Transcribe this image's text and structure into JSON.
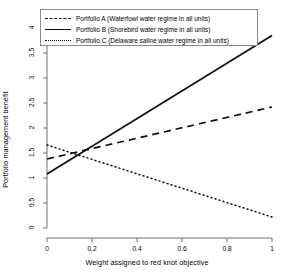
{
  "chart_data": {
    "type": "line",
    "title": "",
    "xlabel": "Weight assigned to red knot objective",
    "ylabel": "Portfolio management benefit",
    "xlim": [
      0,
      1
    ],
    "ylim": [
      0,
      4
    ],
    "xticks": [
      "0",
      "0.2",
      "0.4",
      "0.6",
      "0.8",
      "1"
    ],
    "xtick_values": [
      0,
      0.2,
      0.4,
      0.6,
      0.8,
      1
    ],
    "yticks": [
      "0",
      "0.5",
      "1",
      "1.5",
      "2",
      "2.5",
      "3",
      "3.5",
      "4"
    ],
    "ytick_values": [
      0,
      0.5,
      1,
      1.5,
      2,
      2.5,
      3,
      3.5,
      4
    ],
    "grid": false,
    "legend_position": "top-left",
    "x": [
      0,
      1
    ],
    "series": [
      {
        "name": "Portfolio A (Waterfowl water regime in all units)",
        "style": "dashed",
        "color": "#111111",
        "values": [
          1.38,
          2.42
        ]
      },
      {
        "name": "Portfolio B (Shorebird water regime in all units)",
        "style": "solid",
        "color": "#111111",
        "values": [
          1.08,
          3.85
        ]
      },
      {
        "name": "Portfolio C (Delaware saline water regime in all units)",
        "style": "dotted",
        "color": "#111111",
        "values": [
          1.66,
          0.22
        ]
      }
    ]
  },
  "legend": {
    "items": [
      {
        "label": "Portfolio A (Waterfowl water regime in all units)",
        "style": "dashed"
      },
      {
        "label": "Portfolio B (Shorebird water regime in all units)",
        "style": "solid"
      },
      {
        "label": "Portfolio C (Delaware saline water regime in all units)",
        "style": "dotted"
      }
    ]
  }
}
